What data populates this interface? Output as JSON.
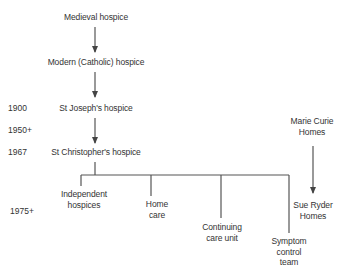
{
  "diagram": {
    "type": "flow-tree",
    "nodes": {
      "medieval": "Medieval hospice",
      "modern": "Modern (Catholic) hospice",
      "st_joseph": "St Joseph's hospice",
      "st_christopher": "St Christopher's hospice",
      "independent_l1": "Independent",
      "independent_l2": "hospices",
      "home_l1": "Home",
      "home_l2": "care",
      "continuing_l1": "Continuing",
      "continuing_l2": "care unit",
      "symptom_l1": "Symptom",
      "symptom_l2": "control",
      "symptom_l3": "team",
      "marie_l1": "Marie Curie",
      "marie_l2": "Homes",
      "sue_l1": "Sue Ryder",
      "sue_l2": "Homes"
    },
    "years": {
      "y1900": "1900",
      "y1950": "1950+",
      "y1967": "1967",
      "y1975": "1975+"
    },
    "edges": [
      {
        "from": "Medieval hospice",
        "to": "Modern (Catholic) hospice",
        "kind": "arrow"
      },
      {
        "from": "Modern (Catholic) hospice",
        "to": "St Joseph's hospice",
        "kind": "arrow"
      },
      {
        "from": "St Joseph's hospice",
        "to": "St Christopher's hospice",
        "kind": "arrow"
      },
      {
        "from": "St Christopher's hospice",
        "to": "Independent hospices",
        "kind": "branch"
      },
      {
        "from": "St Christopher's hospice",
        "to": "Home care",
        "kind": "branch"
      },
      {
        "from": "St Christopher's hospice",
        "to": "Continuing care unit",
        "kind": "branch"
      },
      {
        "from": "St Christopher's hospice",
        "to": "Symptom control team",
        "kind": "branch"
      },
      {
        "from": "Marie Curie Homes",
        "to": "Sue Ryder Homes",
        "kind": "arrow"
      }
    ],
    "colors": {
      "line": "#555555",
      "text": "#333333",
      "background": "#ffffff"
    }
  }
}
